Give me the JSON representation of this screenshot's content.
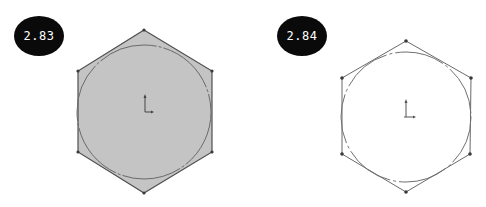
{
  "figures": [
    {
      "label": "2.83",
      "description": "Hexagon inscribed around a circle, filled (shaded)",
      "fill_color": "#c4c4c4",
      "stroke_color": "#555555"
    },
    {
      "label": "2.84",
      "description": "Hexagon inscribed around a circle, outline only",
      "fill_color": "#ffffff",
      "stroke_color": "#666666"
    }
  ]
}
